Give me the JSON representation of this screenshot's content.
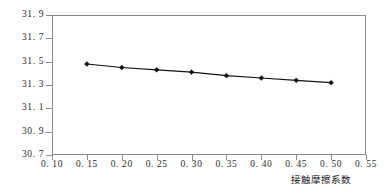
{
  "chart_data": {
    "type": "line",
    "title": "",
    "subtitle": "",
    "xlabel": "接触摩擦系数",
    "ylabel": "最大沉降值/mm",
    "xlim": [
      0.1,
      0.55
    ],
    "ylim": [
      30.7,
      31.9
    ],
    "xticks": [
      0.1,
      0.15,
      0.2,
      0.25,
      0.3,
      0.35,
      0.4,
      0.45,
      0.5,
      0.55
    ],
    "yticks": [
      30.7,
      30.9,
      31.1,
      31.3,
      31.5,
      31.7,
      31.9
    ],
    "xtick_labels": [
      "0. 10",
      "0. 15",
      "0. 20",
      "0. 25",
      "0. 30",
      "0. 35",
      "0. 40",
      "0. 45",
      "0. 50",
      "0. 55"
    ],
    "ytick_labels": [
      "30. 7",
      "30. 9",
      "31. 1",
      "31. 3",
      "31. 5",
      "31. 7",
      "31. 9"
    ],
    "grid": false,
    "legend": null,
    "legend_position": "none",
    "marker": "filled-diamond",
    "line_color": "#111111",
    "marker_color": "#111111",
    "frame_color": "#8a8a8a",
    "background": "#ffffff",
    "x": [
      0.15,
      0.2,
      0.25,
      0.3,
      0.35,
      0.4,
      0.45,
      0.5
    ],
    "values": [
      31.48,
      31.45,
      31.43,
      31.41,
      31.38,
      31.36,
      31.34,
      31.32
    ],
    "series": [
      {
        "name": "最大沉降值",
        "x": [
          0.15,
          0.2,
          0.25,
          0.3,
          0.35,
          0.4,
          0.45,
          0.5
        ],
        "values": [
          31.48,
          31.45,
          31.43,
          31.41,
          31.38,
          31.36,
          31.34,
          31.32
        ]
      }
    ],
    "annotations": []
  }
}
